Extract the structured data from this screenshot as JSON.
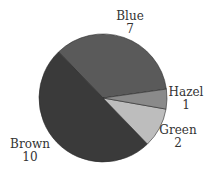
{
  "chart_data": {
    "type": "pie",
    "title": "",
    "center": [
      103,
      98
    ],
    "radius": 64,
    "start_angle_deg": 8,
    "direction": "counterclockwise",
    "slices": [
      {
        "name": "Blue",
        "value": 7,
        "color": "#5a5a5a"
      },
      {
        "name": "Brown",
        "value": 10,
        "color": "#3a3a3a"
      },
      {
        "name": "Green",
        "value": 2,
        "color": "#bdbdbd"
      },
      {
        "name": "Hazel",
        "value": 1,
        "color": "#8a8a8a"
      }
    ],
    "labels": [
      {
        "name": "Blue",
        "value": "7",
        "x": 130,
        "y": 20,
        "anchor": "middle"
      },
      {
        "name": "Hazel",
        "value": "1",
        "x": 186,
        "y": 96,
        "anchor": "middle"
      },
      {
        "name": "Green",
        "value": "2",
        "x": 178,
        "y": 134,
        "anchor": "middle"
      },
      {
        "name": "Brown",
        "value": "10",
        "x": 30,
        "y": 148,
        "anchor": "middle"
      }
    ],
    "legend": "none"
  }
}
